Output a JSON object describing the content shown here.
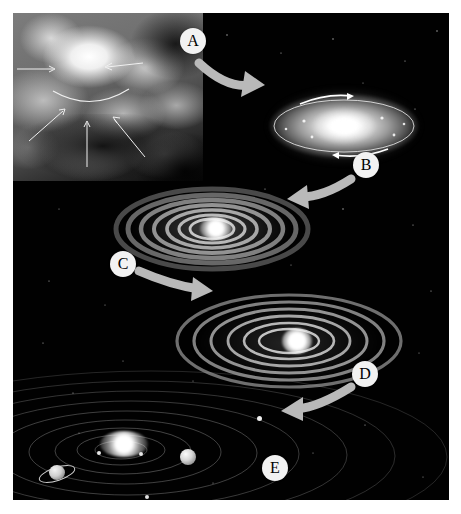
{
  "figure": {
    "background_color": "#010101",
    "page_background": "#ffffff",
    "arrow_color": "#b9b9b9",
    "label_background": "#f2f2f2",
    "label_text_color": "#000000"
  },
  "labels": [
    {
      "id": "A",
      "text": "A",
      "x": 180,
      "y": 28,
      "size": 26
    },
    {
      "id": "B",
      "text": "B",
      "x": 353,
      "y": 152,
      "size": 26
    },
    {
      "id": "C",
      "text": "C",
      "x": 110,
      "y": 251,
      "size": 26
    },
    {
      "id": "D",
      "text": "D",
      "x": 352,
      "y": 361,
      "size": 26
    },
    {
      "id": "E",
      "text": "E",
      "x": 262,
      "y": 455,
      "size": 26
    }
  ],
  "stages": [
    {
      "id": "nebula",
      "name": "collapsing-interstellar-cloud",
      "caption": "Interstellar gas and dust cloud collapsing under gravity"
    },
    {
      "id": "protodisk",
      "name": "flattened-rotating-disk",
      "caption": "Cloud flattens into a hot spinning disk with a bright center"
    },
    {
      "id": "ringdisk1",
      "name": "condensing-ringed-disk",
      "caption": "Disk cools and matter condenses into concentric rings"
    },
    {
      "id": "ringdisk2",
      "name": "separated-rings-protoplanets",
      "caption": "Rings separate as material accretes toward forming planets"
    },
    {
      "id": "solarsystem",
      "name": "formed-solar-system",
      "caption": "Completed solar system: central star with orbiting planets"
    }
  ],
  "nebula_collapse_arrows": [
    {
      "x1": 4,
      "y1": 56,
      "x2": 42,
      "y2": 56
    },
    {
      "x1": 128,
      "y1": 50,
      "x2": 92,
      "y2": 54
    },
    {
      "x1": 18,
      "y1": 126,
      "x2": 52,
      "y2": 96
    },
    {
      "x1": 74,
      "y1": 152,
      "x2": 74,
      "y2": 108
    },
    {
      "x1": 130,
      "y1": 142,
      "x2": 100,
      "y2": 104
    }
  ],
  "rotation_arcs": [
    {
      "stage": "protodisk",
      "cx": 331,
      "cy": 113,
      "rx": 62,
      "ry": 26
    }
  ],
  "flow_arrows": [
    {
      "from": "A",
      "label": "A",
      "direction": "down-right",
      "from_stage": "nebula",
      "to_stage": "protodisk"
    },
    {
      "from": "B",
      "label": "B",
      "direction": "down-left",
      "from_stage": "protodisk",
      "to_stage": "ringdisk1"
    },
    {
      "from": "C",
      "label": "C",
      "direction": "down-right",
      "from_stage": "ringdisk1",
      "to_stage": "ringdisk2"
    },
    {
      "from": "D",
      "label": "D",
      "direction": "down-left",
      "from_stage": "ringdisk2",
      "to_stage": "solarsystem"
    }
  ],
  "solar_system": {
    "star_name": "sun",
    "orbit_count": 9,
    "planets": [
      {
        "name": "saturn",
        "type": "ringed-planet",
        "x": 42,
        "y": 456,
        "size": 17
      },
      {
        "name": "jupiter",
        "type": "gas-giant",
        "x": 175,
        "y": 444,
        "size": 15
      },
      {
        "name": "inner-planet-1",
        "type": "terrestrial",
        "x": 86,
        "y": 440,
        "size": 4
      },
      {
        "name": "inner-planet-2",
        "type": "terrestrial",
        "x": 128,
        "y": 441,
        "size": 4
      },
      {
        "name": "outer-planet-1",
        "type": "distant",
        "x": 246,
        "y": 406,
        "size": 5
      },
      {
        "name": "outer-planet-2",
        "type": "distant",
        "x": 134,
        "y": 494,
        "size": 4
      }
    ]
  }
}
